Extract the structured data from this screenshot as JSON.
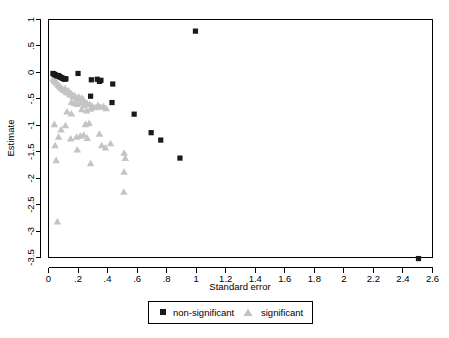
{
  "chart_data": {
    "type": "scatter",
    "title": "",
    "subtitle": "",
    "xlabel": "Standard error",
    "ylabel": "Estimate",
    "xlim": [
      0,
      2.6
    ],
    "ylim": [
      -3.5,
      1
    ],
    "grid": false,
    "legend_position": "bottom",
    "xticks": [
      "0",
      ".2",
      ".4",
      ".6",
      ".8",
      "1",
      "1.2",
      "1.4",
      "1.6",
      "1.8",
      "2",
      "2.2",
      "2.4",
      "2.6"
    ],
    "xtick_values": [
      0,
      0.2,
      0.4,
      0.6,
      0.8,
      1,
      1.2,
      1.4,
      1.6,
      1.8,
      2,
      2.2,
      2.4,
      2.6
    ],
    "yticks": [
      "1",
      ".5",
      "0",
      "-.5",
      "-1",
      "-1.5",
      "-2",
      "-2.5",
      "-3",
      "-3.5"
    ],
    "ytick_values": [
      1,
      0.5,
      0,
      -0.5,
      -1,
      -1.5,
      -2,
      -2.5,
      -3,
      -3.5
    ],
    "series": [
      {
        "name": "non-significant",
        "marker": "square",
        "color": "#1a1a1a",
        "points": [
          [
            0.03,
            -0.02
          ],
          [
            0.035,
            -0.03
          ],
          [
            0.042,
            -0.04
          ],
          [
            0.048,
            -0.05
          ],
          [
            0.055,
            -0.06
          ],
          [
            0.062,
            -0.07
          ],
          [
            0.068,
            -0.06
          ],
          [
            0.074,
            -0.08
          ],
          [
            0.08,
            -0.09
          ],
          [
            0.088,
            -0.1
          ],
          [
            0.095,
            -0.11
          ],
          [
            0.102,
            -0.12
          ],
          [
            0.11,
            -0.13
          ],
          [
            0.118,
            -0.12
          ],
          [
            0.2,
            -0.02
          ],
          [
            0.29,
            -0.14
          ],
          [
            0.33,
            -0.13
          ],
          [
            0.345,
            -0.17
          ],
          [
            0.355,
            -0.15
          ],
          [
            0.435,
            -0.22
          ],
          [
            0.285,
            -0.45
          ],
          [
            0.43,
            -0.57
          ],
          [
            0.58,
            -0.79
          ],
          [
            0.695,
            -1.14
          ],
          [
            0.76,
            -1.28
          ],
          [
            0.89,
            -1.62
          ],
          [
            0.995,
            0.78
          ],
          [
            2.505,
            -3.52
          ]
        ]
      },
      {
        "name": "significant",
        "marker": "triangle",
        "color": "#c4c4c4",
        "points": [
          [
            0.03,
            -0.12
          ],
          [
            0.038,
            -0.15
          ],
          [
            0.045,
            -0.17
          ],
          [
            0.052,
            -0.19
          ],
          [
            0.06,
            -0.21
          ],
          [
            0.068,
            -0.24
          ],
          [
            0.075,
            -0.26
          ],
          [
            0.082,
            -0.28
          ],
          [
            0.09,
            -0.3
          ],
          [
            0.098,
            -0.32
          ],
          [
            0.105,
            -0.34
          ],
          [
            0.112,
            -0.3
          ],
          [
            0.12,
            -0.36
          ],
          [
            0.128,
            -0.38
          ],
          [
            0.135,
            -0.34
          ],
          [
            0.145,
            -0.42
          ],
          [
            0.155,
            -0.4
          ],
          [
            0.165,
            -0.45
          ],
          [
            0.175,
            -0.43
          ],
          [
            0.185,
            -0.47
          ],
          [
            0.195,
            -0.5
          ],
          [
            0.205,
            -0.46
          ],
          [
            0.215,
            -0.53
          ],
          [
            0.225,
            -0.48
          ],
          [
            0.235,
            -0.51
          ],
          [
            0.245,
            -0.55
          ],
          [
            0.155,
            -0.56
          ],
          [
            0.175,
            -0.58
          ],
          [
            0.195,
            -0.6
          ],
          [
            0.215,
            -0.57
          ],
          [
            0.24,
            -0.62
          ],
          [
            0.262,
            -0.58
          ],
          [
            0.28,
            -0.6
          ],
          [
            0.295,
            -0.63
          ],
          [
            0.315,
            -0.66
          ],
          [
            0.335,
            -0.62
          ],
          [
            0.352,
            -0.65
          ],
          [
            0.372,
            -0.64
          ],
          [
            0.39,
            -0.68
          ],
          [
            0.225,
            -0.7
          ],
          [
            0.258,
            -0.72
          ],
          [
            0.285,
            -0.69
          ],
          [
            0.125,
            -0.74
          ],
          [
            0.155,
            -0.78
          ],
          [
            0.04,
            -0.98
          ],
          [
            0.115,
            -1.0
          ],
          [
            0.085,
            -1.08
          ],
          [
            0.25,
            -0.98
          ],
          [
            0.275,
            -0.96
          ],
          [
            0.068,
            -1.22
          ],
          [
            0.19,
            -1.22
          ],
          [
            0.215,
            -1.2
          ],
          [
            0.238,
            -1.18
          ],
          [
            0.345,
            -1.16
          ],
          [
            0.262,
            -1.24
          ],
          [
            0.15,
            -1.25
          ],
          [
            0.045,
            -1.38
          ],
          [
            0.195,
            -1.46
          ],
          [
            0.052,
            -1.66
          ],
          [
            0.36,
            -1.38
          ],
          [
            0.385,
            -1.42
          ],
          [
            0.42,
            -1.34
          ],
          [
            0.512,
            -1.52
          ],
          [
            0.52,
            -1.62
          ],
          [
            0.285,
            -1.72
          ],
          [
            0.512,
            -1.88
          ],
          [
            0.51,
            -2.26
          ],
          [
            0.06,
            -2.82
          ]
        ]
      }
    ]
  },
  "legend": {
    "items": [
      {
        "label": "non-significant",
        "marker": "square",
        "color": "#1a1a1a"
      },
      {
        "label": "significant",
        "marker": "triangle",
        "color": "#c4c4c4"
      }
    ]
  }
}
